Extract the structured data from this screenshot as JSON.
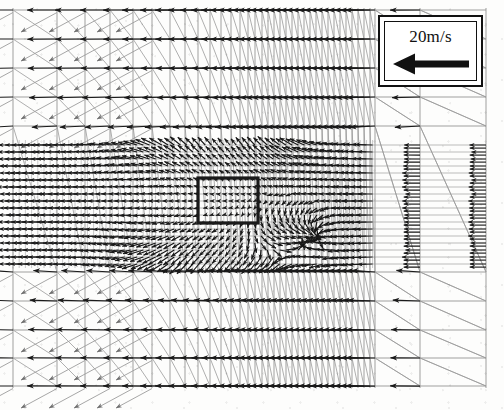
{
  "figure": {
    "background_color": "#fdfdfc",
    "ink_color": "#1a1a1a",
    "width": 504,
    "height": 410
  },
  "legend": {
    "scale_label": "20m/s",
    "arrow_direction": "left",
    "arrow_icon": "left-arrow-icon",
    "box": {
      "x": 378,
      "y": 15,
      "width": 105,
      "height": 72
    },
    "border_color": "#111111",
    "fill_color": "#ffffff"
  },
  "obstacle": {
    "name": "rectangular-obstacle",
    "x": 198,
    "y": 178,
    "width": 60,
    "height": 45,
    "edge_color": "#1a1a1a"
  },
  "chart_data": {
    "type": "scatter",
    "subtype": "vector-field-quiver",
    "xlabel": "",
    "ylabel": "",
    "grid": true,
    "legend_position": "top-right",
    "scale_vector": {
      "label": "20m/s",
      "magnitude": 20,
      "units": "m/s",
      "direction_deg": 180
    },
    "domain": {
      "x0": 13,
      "x1": 486,
      "y0": 8,
      "y1": 388
    },
    "grid_x": [
      13,
      57,
      85,
      110,
      133,
      152,
      170,
      185,
      198,
      210,
      221,
      231,
      240,
      248,
      255,
      262,
      268,
      274,
      280,
      286,
      292,
      298,
      304,
      310,
      316,
      322,
      328,
      334,
      340,
      346,
      352,
      358,
      364,
      370,
      375,
      420,
      486
    ],
    "grid_y_coarse": [
      10,
      39,
      68,
      97,
      126,
      272,
      301,
      330,
      358,
      386
    ],
    "grid_y_fine": [
      145,
      152,
      159,
      166,
      173,
      180,
      187,
      194,
      201,
      208,
      215,
      222,
      229,
      236,
      243,
      250,
      257,
      264
    ],
    "bands": [
      {
        "name": "upper-freestream",
        "y0": 8,
        "y1": 132,
        "flow": "uniform leftward",
        "speed": 20
      },
      {
        "name": "dense-shear-layer",
        "y0": 140,
        "y1": 268,
        "flow": "disturbed / recirculating",
        "speed_range": [
          0,
          22
        ]
      },
      {
        "name": "lower-freestream",
        "y0": 270,
        "y1": 390,
        "flow": "uniform leftward",
        "speed": 20
      }
    ],
    "features": [
      {
        "name": "rectangular-obstacle",
        "x": 198,
        "y": 178,
        "w": 60,
        "h": 45
      },
      {
        "name": "recirculation-vortex",
        "x": 275,
        "y": 235,
        "note": "downstream wake / reversed flow"
      },
      {
        "name": "separation-shear-layer",
        "x": 160,
        "y": 170,
        "note": "upstream of obstacle"
      },
      {
        "name": "outlet-column-band",
        "x0": 375,
        "x1": 486,
        "note": "stacked horizontal vectors"
      }
    ]
  }
}
